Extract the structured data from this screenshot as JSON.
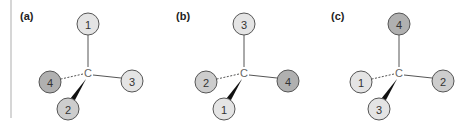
{
  "panels": [
    {
      "label": "(a)",
      "center": "C",
      "top": {
        "number": "1",
        "shade": "light"
      },
      "left": {
        "number": "4",
        "shade": "dark"
      },
      "right": {
        "number": "3",
        "shade": "light"
      },
      "front": {
        "number": "2",
        "shade": "medium"
      }
    },
    {
      "label": "(b)",
      "center": "C",
      "top": {
        "number": "3",
        "shade": "light"
      },
      "left": {
        "number": "2",
        "shade": "medium"
      },
      "right": {
        "number": "4",
        "shade": "dark"
      },
      "front": {
        "number": "1",
        "shade": "light"
      }
    },
    {
      "label": "(c)",
      "center": "C",
      "top": {
        "number": "4",
        "shade": "dark"
      },
      "left": {
        "number": "1",
        "shade": "light"
      },
      "right": {
        "number": "2",
        "shade": "medium"
      },
      "front": {
        "number": "3",
        "shade": "light"
      }
    }
  ],
  "colors": {
    "light": "#e4e4e4",
    "medium": "#cdcdcd",
    "dark": "#b0b0b0",
    "stroke": "#555555",
    "divider": "#c8c8c8"
  }
}
